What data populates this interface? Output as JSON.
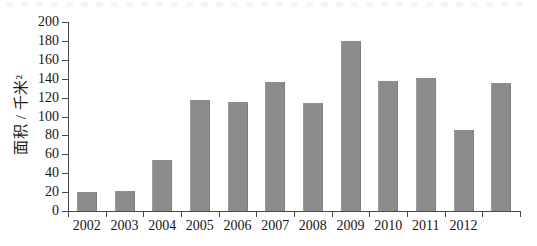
{
  "chart_data": {
    "type": "bar",
    "title": "",
    "subtitle": "",
    "xlabel": "",
    "ylabel": "面积 / 千米²",
    "categories": [
      "2002",
      "2003",
      "2004",
      "2005",
      "2006",
      "2007",
      "2008",
      "2009",
      "2010",
      "2011",
      "2012",
      ""
    ],
    "values": [
      20,
      21,
      54,
      118,
      115,
      136,
      114,
      180,
      138,
      141,
      86,
      135
    ],
    "ylim": [
      0,
      200
    ],
    "ytick_interval": 20,
    "yticks": [
      0,
      20,
      40,
      60,
      80,
      100,
      120,
      140,
      160,
      180,
      200
    ],
    "ytick_labels": [
      "0",
      "20",
      "40",
      "60",
      "80",
      "100",
      "120",
      "140",
      "160",
      "180",
      "200"
    ],
    "grid": false,
    "legend": null,
    "legend_position": "none",
    "bar_color": "#8c8c8c",
    "axis_color": "#4a4a4a",
    "annotations": []
  },
  "figure": {
    "background_color": "#ffffff",
    "text_color": "#161616"
  }
}
